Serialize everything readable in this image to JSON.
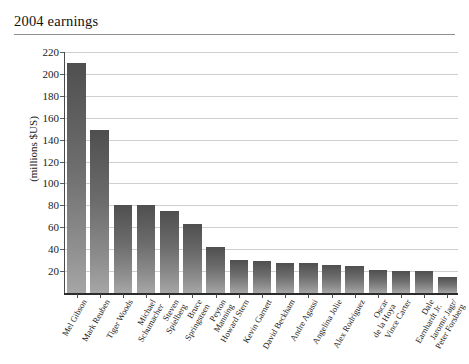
{
  "chart_data": {
    "type": "bar",
    "title": "2004 earnings",
    "xlabel": "",
    "ylabel": "(millions $US)",
    "ylim": [
      0,
      220
    ],
    "yticks": [
      20,
      40,
      60,
      80,
      100,
      120,
      140,
      160,
      180,
      200,
      220
    ],
    "grid": true,
    "legend": "none",
    "units": "millions $US",
    "categories": [
      "Mel Gibson",
      "Mark Reuben",
      "Tiger Woods",
      "Michael Schumacher",
      "Steven Spielberg",
      "Bruce Springsteen",
      "Peyton Manning",
      "Howard Stern",
      "Kevin Garnett",
      "David Beckham",
      "Andre Agassi",
      "Angelina Jolie",
      "Alex Rodriguez",
      "Oscar de la Hoya",
      "Vince Carter",
      "Dale Earnhardt Jr.",
      "Jaromir Jagr/ Peter Forsberg"
    ],
    "category_lines": [
      [
        "Mel Gibson"
      ],
      [
        "Mark Reuben"
      ],
      [
        "Tiger Woods"
      ],
      [
        "Michael",
        "Schumacher"
      ],
      [
        "Steven",
        "Spielberg"
      ],
      [
        "Bruce",
        "Springsteen"
      ],
      [
        "Peyton",
        "Manning"
      ],
      [
        "Howard Stern"
      ],
      [
        "Kevin Garnett"
      ],
      [
        "David Beckham"
      ],
      [
        "Andre Agassi"
      ],
      [
        "Angelina Jolie"
      ],
      [
        "Alex Rodriguez"
      ],
      [
        "Oscar",
        "de la Hoya"
      ],
      [
        "Vince Carter"
      ],
      [
        "Dale",
        "Earnhardt Jr."
      ],
      [
        "Jaromir Jagr/",
        "Peter Forsberg"
      ]
    ],
    "values": [
      210,
      149,
      80,
      80,
      75,
      63,
      42,
      30,
      29,
      27,
      27,
      26,
      25,
      21,
      20,
      20,
      15
    ],
    "colors": {
      "bar_top": "#4f4f4f",
      "bar_bottom": "#a6a6a6",
      "gridline": "#cfcfcf",
      "axis": "#2b2b2b",
      "text": "#1a1a1a",
      "title_rule": "#8e8e8e",
      "background": "#ffffff"
    }
  }
}
